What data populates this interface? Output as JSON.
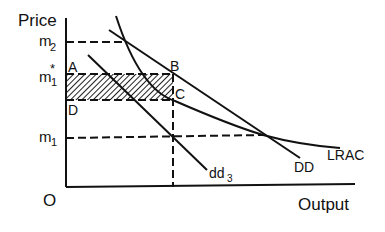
{
  "diagram": {
    "axes": {
      "y_label": "Price",
      "x_label": "Output",
      "origin_label": "O"
    },
    "price_levels": {
      "m2": {
        "main": "m",
        "sub": "2"
      },
      "m1_star": {
        "main": "m",
        "sub": "1",
        "sup": "*"
      },
      "m1": {
        "main": "m",
        "sub": "1"
      }
    },
    "points": {
      "A": "A",
      "B": "B",
      "C": "C",
      "D": "D"
    },
    "curves": {
      "dd3": {
        "main": "dd",
        "sub": "3"
      },
      "DD": "DD",
      "LRAC": "LRAC"
    },
    "colors": {
      "line": "#111111",
      "background": "#ffffff"
    }
  }
}
